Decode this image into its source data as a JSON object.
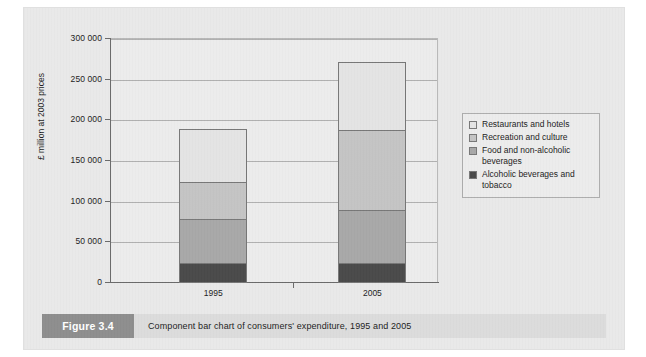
{
  "figure": {
    "tag": "Figure 3.4",
    "caption": "Component bar chart of consumers' expenditure, 1995 and 2005"
  },
  "axis": {
    "y_title": "£ million at 2003 prices",
    "ticks": [
      "0",
      "50 000",
      "100 000",
      "150 000",
      "200 000",
      "250 000",
      "300 000"
    ]
  },
  "legend": {
    "items": [
      {
        "label": "Restaurants and hotels",
        "color": "#e4e4e4"
      },
      {
        "label": "Recreation and culture",
        "color": "#c4c4c4"
      },
      {
        "label": "Food and non-alcoholic beverages",
        "color": "#a8a8a8"
      },
      {
        "label": "Alcoholic beverages and tobacco",
        "color": "#4a4a4a"
      }
    ]
  },
  "chart_data": {
    "type": "bar",
    "subtype": "stacked",
    "title": "Component bar chart of consumers' expenditure, 1995 and 2005",
    "xlabel": "",
    "ylabel": "£ million at 2003 prices",
    "categories": [
      "1995",
      "2005"
    ],
    "ylim": [
      0,
      300000
    ],
    "ytick_step": 50000,
    "yticks": [
      0,
      50000,
      100000,
      150000,
      200000,
      250000,
      300000
    ],
    "grid": true,
    "legend_position": "right",
    "series": [
      {
        "name": "Alcoholic beverages and tobacco",
        "color": "#4a4a4a",
        "values": [
          25000,
          25000
        ]
      },
      {
        "name": "Food and non-alcoholic beverages",
        "color": "#a8a8a8",
        "values": [
          55000,
          66000
        ]
      },
      {
        "name": "Recreation and culture",
        "color": "#c4c4c4",
        "values": [
          47000,
          99000
        ]
      },
      {
        "name": "Restaurants and hotels",
        "color": "#e4e4e4",
        "values": [
          66000,
          85000
        ]
      }
    ],
    "cumulative_tops": {
      "1995": [
        25000,
        80000,
        127000,
        193000
      ],
      "2005": [
        25000,
        91000,
        190000,
        275000
      ]
    },
    "totals": [
      193000,
      275000
    ]
  }
}
